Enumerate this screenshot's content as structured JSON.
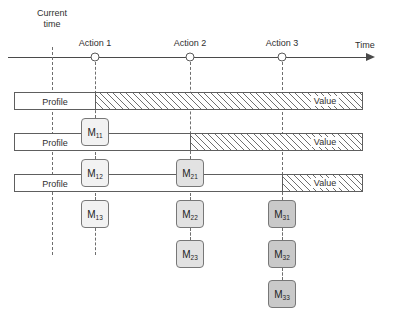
{
  "diagram": {
    "title": "",
    "axis": {
      "label": "Time",
      "current_time_label_line1": "Current",
      "current_time_label_line2": "time",
      "ticks": [
        {
          "id": "action-1",
          "label": "Action 1",
          "x": 95
        },
        {
          "id": "action-2",
          "label": "Action 2",
          "x": 190
        },
        {
          "id": "action-3",
          "label": "Action 3",
          "x": 282
        }
      ],
      "current_time_x": 52
    },
    "rows": [
      {
        "id": "row-1",
        "profile_label": "Profile",
        "value_label": "Value",
        "profile_end_x": 95,
        "bar_left": 14,
        "bar_right": 363,
        "top": 92
      },
      {
        "id": "row-2",
        "profile_label": "Profile",
        "value_label": "Value",
        "profile_end_x": 190,
        "bar_left": 14,
        "bar_right": 363,
        "top": 133
      },
      {
        "id": "row-3",
        "profile_label": "Profile",
        "value_label": "Value",
        "profile_end_x": 282,
        "bar_left": 14,
        "bar_right": 363,
        "top": 174
      }
    ],
    "nodes": [
      {
        "id": "m11",
        "main": "M",
        "sub": "11",
        "x": 95,
        "y": 118,
        "shade": "light"
      },
      {
        "id": "m12",
        "main": "M",
        "sub": "12",
        "x": 95,
        "y": 159,
        "shade": "light"
      },
      {
        "id": "m13",
        "main": "M",
        "sub": "13",
        "x": 95,
        "y": 200,
        "shade": "light"
      },
      {
        "id": "m21",
        "main": "M",
        "sub": "21",
        "x": 190,
        "y": 159,
        "shade": "mid"
      },
      {
        "id": "m22",
        "main": "M",
        "sub": "22",
        "x": 190,
        "y": 200,
        "shade": "mid"
      },
      {
        "id": "m23",
        "main": "M",
        "sub": "23",
        "x": 190,
        "y": 240,
        "shade": "mid"
      },
      {
        "id": "m31",
        "main": "M",
        "sub": "31",
        "x": 282,
        "y": 200,
        "shade": "dark"
      },
      {
        "id": "m32",
        "main": "M",
        "sub": "32",
        "x": 282,
        "y": 240,
        "shade": "dark"
      },
      {
        "id": "m33",
        "main": "M",
        "sub": "33",
        "x": 282,
        "y": 280,
        "shade": "dark"
      }
    ],
    "colors": {
      "line": "#4a4a4a",
      "dashed": "#6e6e6e",
      "hatch": "#6f6f6f",
      "box_border": "#777777",
      "shade_light": "#f2f2f2",
      "shade_mid": "#e2e2e2",
      "shade_dark": "#c9c9c9"
    }
  }
}
